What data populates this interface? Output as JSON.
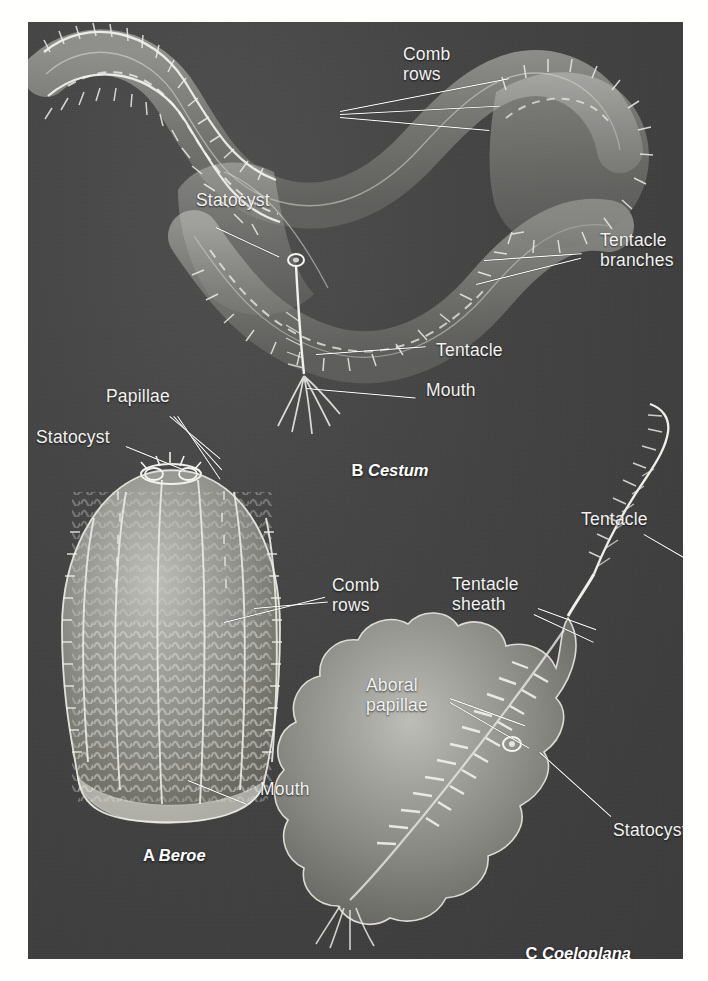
{
  "figure": {
    "background_color": "#474747",
    "label_color": "#f2f2f0",
    "page_color": "#fffffd"
  },
  "panels": [
    {
      "id": "A",
      "letter": "A",
      "taxon": "Beroe"
    },
    {
      "id": "B",
      "letter": "B",
      "taxon": "Cestum"
    },
    {
      "id": "C",
      "letter": "C",
      "taxon": "Coeloplana"
    }
  ],
  "labels": {
    "comb_rows_b": "Comb\nrows",
    "statocyst_b": "Statocyst",
    "tentacle_branches_b": "Tentacle\nbranches",
    "tentacle_b": "Tentacle",
    "mouth_b": "Mouth",
    "papillae_a": "Papillae",
    "statocyst_a": "Statocyst",
    "comb_rows_a": "Comb\nrows",
    "mouth_a": "Mouth",
    "tentacle_c": "Tentacle",
    "tentacle_sheath_c": "Tentacle\nsheath",
    "aboral_papillae_c": "Aboral\npapillae",
    "statocyst_c": "Statocyst"
  },
  "captions": {
    "a_letter": "A ",
    "a_taxon": "Beroe",
    "b_letter": "B ",
    "b_taxon": "Cestum",
    "c_letter": "C ",
    "c_taxon": "Coeloplana"
  }
}
